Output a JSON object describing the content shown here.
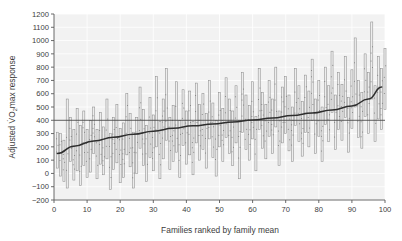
{
  "chart_data": {
    "type": "bar",
    "title": "",
    "subtitle": "",
    "xlabel": "Families ranked by family mean",
    "ylabel_parts": {
      "lead": "Adjusted V",
      "symbol": "O",
      "subscript": "2",
      "trail": "max response"
    },
    "ylabel": "Adjusted VO2max response",
    "xlim": [
      0,
      100
    ],
    "ylim": [
      -200,
      1200
    ],
    "xticks": [
      0,
      10,
      20,
      30,
      40,
      50,
      60,
      70,
      80,
      90,
      100
    ],
    "ytick_labels": [
      "1200",
      "1100",
      "1000",
      "900",
      "800",
      "700",
      "600",
      "500",
      "400",
      "300",
      "200",
      "100",
      "0",
      "-100",
      "-200"
    ],
    "yticks": [
      1200,
      1100,
      1000,
      900,
      800,
      700,
      600,
      500,
      400,
      300,
      200,
      100,
      0,
      -100,
      -200
    ],
    "grid": true,
    "grid_color": "#ffffff",
    "plot_background": "#f2f2f2",
    "legend": null,
    "legend_position": "none",
    "bar_style": {
      "fill": "#ededed",
      "edge": "#8f8f8f",
      "description": "vertical range bars spanning min-to-max of each family's member responses"
    },
    "reference_line": {
      "y": 400,
      "label": "overall mean",
      "color": "#4a4a4a"
    },
    "trend_line": {
      "name": "family mean (ranked)",
      "color": "#2e2e2e",
      "description": "monotonically increasing family mean across ranked families",
      "x": [
        1,
        6,
        12,
        18,
        24,
        30,
        36,
        42,
        48,
        54,
        60,
        66,
        72,
        78,
        84,
        90,
        95,
        99
      ],
      "y": [
        150,
        205,
        245,
        272,
        295,
        318,
        340,
        358,
        372,
        388,
        402,
        418,
        436,
        455,
        478,
        508,
        560,
        650
      ]
    },
    "categories": [
      1,
      2,
      3,
      4,
      5,
      6,
      7,
      8,
      9,
      10,
      11,
      12,
      13,
      14,
      15,
      16,
      17,
      18,
      19,
      20,
      21,
      22,
      23,
      24,
      25,
      26,
      27,
      28,
      29,
      30,
      31,
      32,
      33,
      34,
      35,
      36,
      37,
      38,
      39,
      40,
      41,
      42,
      43,
      44,
      45,
      46,
      47,
      48,
      49,
      50,
      51,
      52,
      53,
      54,
      55,
      56,
      57,
      58,
      59,
      60,
      61,
      62,
      63,
      64,
      65,
      66,
      67,
      68,
      69,
      70,
      71,
      72,
      73,
      74,
      75,
      76,
      77,
      78,
      79,
      80,
      81,
      82,
      83,
      84,
      85,
      86,
      87,
      88,
      89,
      90,
      91,
      92,
      93,
      94,
      95,
      96,
      97,
      98,
      99,
      100
    ],
    "series": [
      {
        "name": "range_low",
        "values": [
          40,
          -20,
          -60,
          -110,
          90,
          -50,
          20,
          -90,
          60,
          -30,
          10,
          150,
          -40,
          70,
          -10,
          110,
          -120,
          30,
          80,
          -70,
          -30,
          140,
          50,
          -110,
          0,
          190,
          60,
          -60,
          120,
          20,
          200,
          -40,
          110,
          250,
          30,
          90,
          160,
          -30,
          210,
          70,
          140,
          -10,
          230,
          100,
          180,
          40,
          260,
          120,
          -20,
          200,
          90,
          270,
          150,
          60,
          230,
          -40,
          310,
          180,
          100,
          260,
          20,
          330,
          190,
          110,
          280,
          150,
          350,
          60,
          230,
          300,
          170,
          90,
          360,
          240,
          130,
          310,
          200,
          400,
          150,
          280,
          90,
          370,
          240,
          460,
          180,
          330,
          250,
          420,
          160,
          340,
          500,
          270,
          190,
          430,
          300,
          560,
          240,
          410,
          330,
          480
        ]
      },
      {
        "name": "range_high",
        "values": [
          310,
          300,
          250,
          560,
          420,
          330,
          490,
          360,
          470,
          330,
          400,
          500,
          330,
          460,
          350,
          560,
          300,
          420,
          520,
          340,
          380,
          600,
          450,
          310,
          420,
          650,
          480,
          360,
          570,
          440,
          730,
          390,
          560,
          790,
          420,
          510,
          690,
          400,
          630,
          470,
          620,
          390,
          680,
          520,
          600,
          450,
          700,
          530,
          400,
          610,
          490,
          720,
          560,
          470,
          660,
          400,
          760,
          590,
          510,
          690,
          430,
          790,
          610,
          520,
          700,
          560,
          800,
          470,
          650,
          730,
          590,
          500,
          790,
          660,
          540,
          740,
          620,
          860,
          560,
          700,
          500,
          800,
          660,
          920,
          590,
          760,
          670,
          880,
          570,
          780,
          1020,
          700,
          610,
          900,
          760,
          1140,
          660,
          880,
          790,
          940
        ]
      }
    ]
  }
}
